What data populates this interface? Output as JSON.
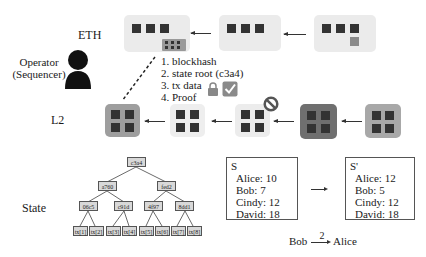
{
  "labels": {
    "eth": "ETH",
    "operator_line1": "Operator",
    "operator_line2": "(Sequencer)",
    "l2": "L2",
    "state": "State"
  },
  "commitment_list": [
    "1. blockhash",
    "2. state root (c3a4)",
    "3. tx data",
    "4. Proof"
  ],
  "eth_chain": {
    "blocks": [
      {
        "id": "eth-block-1",
        "squares": 3,
        "has_l2_batch": true
      },
      {
        "id": "eth-block-2",
        "squares": 3
      },
      {
        "id": "eth-block-3",
        "squares": 3,
        "has_pending_tx": true
      }
    ]
  },
  "l2_chain": {
    "blocks": [
      {
        "id": "l2-block-1",
        "shade": "#9e9e9e",
        "state": "finalized"
      },
      {
        "id": "l2-block-2",
        "shade": "#eeeeee",
        "state": "rejected-marker"
      },
      {
        "id": "l2-block-3",
        "shade": "#ececec",
        "state": "normal"
      },
      {
        "id": "l2-block-4",
        "shade": "#6f6f6f",
        "state": "dark"
      },
      {
        "id": "l2-block-5",
        "shade": "#a8a8a8",
        "state": "normal"
      }
    ]
  },
  "merkle_tree": {
    "root": "c3a4",
    "level1": [
      "a760",
      "fed2"
    ],
    "level2": [
      "06c5",
      "c91d",
      "4f97",
      "8dd1"
    ],
    "leaves": [
      "tx[1]",
      "tx[2]",
      "tx[3]",
      "tx[4]",
      "tx[5]",
      "tx[6]",
      "tx[7]",
      "tx[8]"
    ]
  },
  "state_before": {
    "title": "S",
    "rows": [
      "Alice: 10",
      "Bob: 7",
      "Cindy: 12",
      "David: 18"
    ]
  },
  "state_after": {
    "title": "S'",
    "rows": [
      "Alice: 12",
      "Bob: 5",
      "Cindy: 12",
      "David: 18"
    ]
  },
  "transfer": {
    "from": "Bob",
    "amount": "2",
    "to": "Alice"
  },
  "colors": {
    "block_light": "#ebebeb",
    "square_dark": "#333333",
    "pending_square": "#8a8a8a"
  }
}
